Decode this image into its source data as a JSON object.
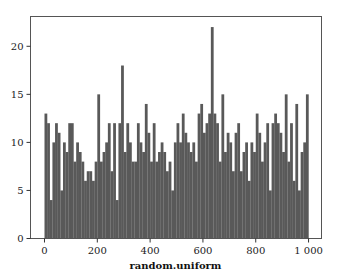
{
  "chart_data": {
    "type": "bar",
    "subtype": "histogram",
    "title": "",
    "xlabel": "random.uniform",
    "ylabel": "",
    "xlim": [
      -53,
      1049
    ],
    "ylim": [
      0,
      23.1
    ],
    "grid": false,
    "legend": null,
    "bar_color": "#595959",
    "bin_width": 10,
    "x_ticks": [
      0,
      200,
      400,
      600,
      800,
      1000
    ],
    "x_tick_labels": [
      "0",
      "200",
      "400",
      "600",
      "800",
      "1 000"
    ],
    "y_ticks": [
      0,
      5,
      10,
      15,
      20
    ],
    "y_tick_labels": [
      "0",
      "5",
      "10",
      "15",
      "20"
    ],
    "bin_starts": [
      0,
      10,
      20,
      30,
      40,
      50,
      60,
      70,
      80,
      90,
      100,
      110,
      120,
      130,
      140,
      150,
      160,
      170,
      180,
      190,
      200,
      210,
      220,
      230,
      240,
      250,
      260,
      270,
      280,
      290,
      300,
      310,
      320,
      330,
      340,
      350,
      360,
      370,
      380,
      390,
      400,
      410,
      420,
      430,
      440,
      450,
      460,
      470,
      480,
      490,
      500,
      510,
      520,
      530,
      540,
      550,
      560,
      570,
      580,
      590,
      600,
      610,
      620,
      630,
      640,
      650,
      660,
      670,
      680,
      690,
      700,
      710,
      720,
      730,
      740,
      750,
      760,
      770,
      780,
      790,
      800,
      810,
      820,
      830,
      840,
      850,
      860,
      870,
      880,
      890,
      900,
      910,
      920,
      930,
      940,
      950,
      960,
      970,
      980,
      990
    ],
    "values": [
      13,
      12,
      4,
      10,
      12,
      11,
      5,
      10,
      9,
      12,
      12,
      8,
      10,
      9,
      8,
      6,
      7,
      7,
      6,
      8,
      15,
      8,
      9,
      10,
      12,
      7,
      12,
      4,
      12,
      18,
      9,
      12,
      10,
      8,
      8,
      12,
      10,
      9,
      14,
      11,
      8,
      12,
      8,
      9,
      10,
      9,
      7,
      8,
      5,
      10,
      12,
      10,
      13,
      11,
      10,
      9,
      10,
      8,
      13,
      14,
      11,
      12,
      13,
      22,
      13,
      12,
      8,
      15,
      9,
      11,
      10,
      7,
      11,
      12,
      7,
      9,
      10,
      6,
      10,
      9,
      13,
      11,
      8,
      10,
      12,
      5,
      12,
      13,
      12,
      11,
      9,
      15,
      8,
      12,
      6,
      14,
      5,
      9,
      10,
      15
    ],
    "total_count": 1000
  },
  "axes": {
    "frame_color": "#555555",
    "tick_color": "#333333"
  }
}
